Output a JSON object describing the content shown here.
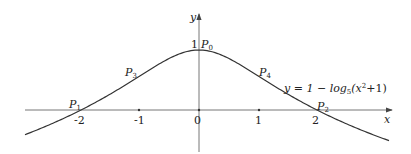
{
  "diagram": {
    "axes": {
      "x_label": "x",
      "y_label": "y",
      "origin_label": "0",
      "x_ticks": [
        "-2",
        "-1",
        "1",
        "2"
      ],
      "y_tick": "1"
    },
    "equation": "y = 1 − log₅(x²+1)",
    "equation_parts": {
      "prefix": "y = 1 − log",
      "base": "5",
      "arg_open": "(x",
      "exp": "2",
      "arg_close": "+1)"
    },
    "points": [
      {
        "name": "P",
        "sub": "0",
        "x": 0,
        "y": 1
      },
      {
        "name": "P",
        "sub": "1",
        "x": -2,
        "y": 0
      },
      {
        "name": "P",
        "sub": "2",
        "x": 2,
        "y": 0
      },
      {
        "name": "P",
        "sub": "3",
        "x": -1,
        "y": 0.57
      },
      {
        "name": "P",
        "sub": "4",
        "x": 1,
        "y": 0.57
      }
    ],
    "colors": {
      "curve": "#333333",
      "axis": "#555555"
    }
  }
}
